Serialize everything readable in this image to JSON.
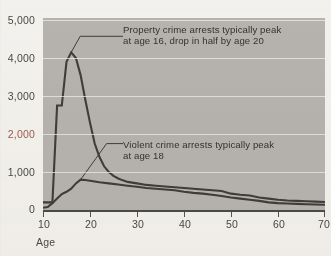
{
  "chart_data": {
    "type": "line",
    "title": "",
    "xlabel": "Age",
    "ylabel": "",
    "xlim": [
      10,
      70
    ],
    "ylim": [
      0,
      5000
    ],
    "grid": true,
    "legend": "none",
    "x_ticks": [
      "10",
      "20",
      "30",
      "40",
      "50",
      "60",
      "70"
    ],
    "y_ticks": [
      "5,000",
      "4,000",
      "3,000",
      "2,000",
      "1,000",
      "0"
    ],
    "y_tick_accent": "2,000",
    "series": [
      {
        "name": "Property crime arrests",
        "x": [
          10,
          11,
          12,
          13,
          14,
          15,
          16,
          17,
          18,
          19,
          20,
          21,
          22,
          23,
          24,
          25,
          26,
          27,
          28,
          30,
          32,
          34,
          36,
          38,
          40,
          42,
          44,
          46,
          48,
          50,
          52,
          54,
          56,
          58,
          60,
          62,
          64,
          66,
          68,
          70
        ],
        "values": [
          200,
          200,
          200,
          2750,
          2750,
          3900,
          4150,
          4000,
          3550,
          2900,
          2300,
          1750,
          1400,
          1150,
          1000,
          900,
          830,
          780,
          740,
          700,
          660,
          640,
          620,
          600,
          580,
          560,
          540,
          520,
          500,
          430,
          400,
          380,
          330,
          300,
          270,
          250,
          240,
          230,
          220,
          210
        ]
      },
      {
        "name": "Violent crime arrests",
        "x": [
          10,
          11,
          12,
          13,
          14,
          15,
          16,
          17,
          18,
          19,
          20,
          22,
          24,
          26,
          28,
          30,
          32,
          34,
          36,
          38,
          40,
          42,
          44,
          46,
          48,
          50,
          52,
          54,
          56,
          58,
          60,
          62,
          64,
          66,
          68,
          70
        ],
        "values": [
          60,
          80,
          180,
          300,
          420,
          480,
          560,
          700,
          800,
          790,
          770,
          730,
          700,
          670,
          640,
          610,
          580,
          560,
          540,
          520,
          480,
          450,
          430,
          400,
          370,
          330,
          300,
          270,
          240,
          200,
          180,
          170,
          160,
          150,
          145,
          140
        ]
      }
    ],
    "annotations": [
      {
        "id": "property",
        "text": "Property crime arrests typically peak\nat age 16, drop in half by age 20",
        "points_to_age": 16
      },
      {
        "id": "violent",
        "text": "Violent crime arrests typically peak\nat age 18",
        "points_to_age": 18
      }
    ],
    "colors": {
      "plot_background": "#b6b3af",
      "page_background": "#f3f1ed",
      "line": "#3f3d3a",
      "gridline": "#eeece7",
      "axis": "#4d4b48",
      "text": "#4a4845",
      "accent_label": "#9d5b52"
    }
  }
}
